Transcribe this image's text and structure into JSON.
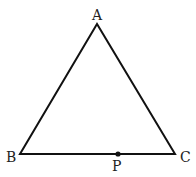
{
  "diagram": {
    "type": "triangle",
    "stroke_color": "#111111",
    "vertices": {
      "A": {
        "label": "A",
        "x": 97,
        "y": 24
      },
      "B": {
        "label": "B",
        "x": 20,
        "y": 154
      },
      "C": {
        "label": "C",
        "x": 175,
        "y": 154
      }
    },
    "points": {
      "P": {
        "label": "P",
        "x": 118,
        "y": 154,
        "on_segment": "BC"
      }
    },
    "edge_fragment_text": "ǐ"
  }
}
